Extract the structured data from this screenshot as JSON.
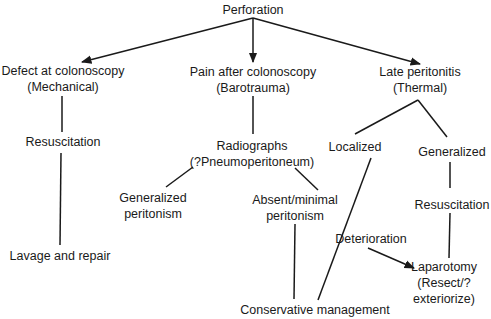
{
  "diagram": {
    "type": "flowchart",
    "colors": {
      "line": "#1a1a1a",
      "text": "#1a1a1a",
      "background": "#ffffff"
    },
    "nodes": {
      "root": {
        "lines": [
          "Perforation"
        ]
      },
      "mechanical": {
        "lines": [
          "Defect at colonoscopy",
          "(Mechanical)"
        ]
      },
      "mech_resus": {
        "lines": [
          "Resuscitation"
        ]
      },
      "lavage": {
        "lines": [
          "Lavage and repair"
        ]
      },
      "barotrauma": {
        "lines": [
          "Pain after colonoscopy",
          "(Barotrauma)"
        ]
      },
      "radiographs": {
        "lines": [
          "Radiographs",
          "(?Pneumoperitoneum)"
        ]
      },
      "gen_peritonism": {
        "lines": [
          "Generalized",
          "peritonism"
        ]
      },
      "absent_peritonism": {
        "lines": [
          "Absent/minimal",
          "peritonism"
        ]
      },
      "conservative": {
        "lines": [
          "Conservative management"
        ]
      },
      "thermal": {
        "lines": [
          "Late peritonitis",
          "(Thermal)"
        ]
      },
      "localized": {
        "lines": [
          "Localized"
        ]
      },
      "generalized": {
        "lines": [
          "Generalized"
        ]
      },
      "thermal_resus": {
        "lines": [
          "Resuscitation"
        ]
      },
      "deterioration": {
        "lines": [
          "Deterioration"
        ]
      },
      "laparotomy": {
        "lines": [
          "Laparotomy",
          "(Resect/?",
          "exteriorize)"
        ]
      }
    },
    "edges": [
      {
        "from": "root",
        "to": "mechanical",
        "arrow": true
      },
      {
        "from": "root",
        "to": "barotrauma",
        "arrow": true
      },
      {
        "from": "root",
        "to": "thermal",
        "arrow": true
      },
      {
        "from": "mechanical",
        "to": "mech_resus",
        "arrow": false
      },
      {
        "from": "mech_resus",
        "to": "lavage",
        "arrow": false
      },
      {
        "from": "barotrauma",
        "to": "radiographs",
        "arrow": false
      },
      {
        "from": "radiographs",
        "to": "gen_peritonism",
        "arrow": false
      },
      {
        "from": "radiographs",
        "to": "absent_peritonism",
        "arrow": false
      },
      {
        "from": "absent_peritonism",
        "to": "conservative",
        "arrow": false
      },
      {
        "from": "thermal",
        "to": "localized",
        "arrow": false
      },
      {
        "from": "thermal",
        "to": "generalized",
        "arrow": false
      },
      {
        "from": "localized",
        "to": "conservative",
        "arrow": false
      },
      {
        "from": "generalized",
        "to": "thermal_resus",
        "arrow": false
      },
      {
        "from": "thermal_resus",
        "to": "laparotomy",
        "arrow": false
      },
      {
        "from": "deterioration",
        "to": "laparotomy",
        "arrow": true
      }
    ]
  }
}
